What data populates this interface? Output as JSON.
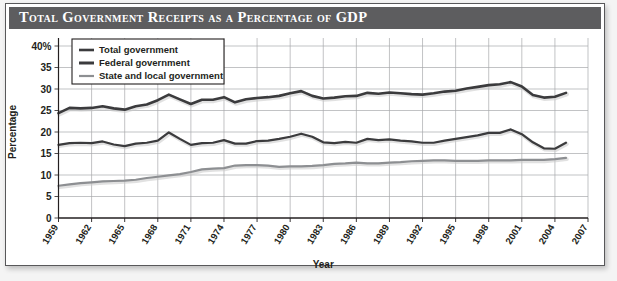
{
  "figure": {
    "title": "Total Government Receipts as a Percentage of GDP",
    "frame_color": "#58585a",
    "title_band_color": "#5d5d5f",
    "background_color": "#ffffff",
    "page_color": "#f2f2f2"
  },
  "chart_data": {
    "type": "line",
    "title": "Total Government Receipts as a Percentage of GDP",
    "xlabel": "Year",
    "ylabel": "Percentage",
    "xlim": [
      1959,
      2007
    ],
    "ylim": [
      0,
      40
    ],
    "yticks": [
      0,
      5,
      10,
      15,
      20,
      25,
      30,
      35,
      40
    ],
    "ytick_labels": [
      "0",
      "5",
      "10",
      "15",
      "20",
      "25",
      "30",
      "35",
      "40%"
    ],
    "xticks": [
      1959,
      1962,
      1965,
      1968,
      1971,
      1974,
      1977,
      1980,
      1983,
      1986,
      1989,
      1992,
      1995,
      1998,
      2001,
      2004,
      2007
    ],
    "xtick_labels": [
      "1959",
      "1962",
      "1965",
      "1968",
      "1971",
      "1974",
      "1977",
      "1980",
      "1983",
      "1986",
      "1989",
      "1992",
      "1995",
      "1998",
      "2001",
      "2004",
      "2007"
    ],
    "grid": true,
    "grid_color": "#a7a9ac",
    "legend_position": "top-left",
    "x": [
      1959,
      1960,
      1961,
      1962,
      1963,
      1964,
      1965,
      1966,
      1967,
      1968,
      1969,
      1970,
      1971,
      1972,
      1973,
      1974,
      1975,
      1976,
      1977,
      1978,
      1979,
      1980,
      1981,
      1982,
      1983,
      1984,
      1985,
      1986,
      1987,
      1988,
      1989,
      1990,
      1991,
      1992,
      1993,
      1994,
      1995,
      1996,
      1997,
      1998,
      1999,
      2000,
      2001,
      2002,
      2003,
      2004,
      2005
    ],
    "series": [
      {
        "name": "Total government",
        "color": "#3b3b3d",
        "width": 2.6,
        "values": [
          24.4,
          25.6,
          25.5,
          25.6,
          26.0,
          25.5,
          25.2,
          26.0,
          26.4,
          27.4,
          28.7,
          27.6,
          26.5,
          27.5,
          27.5,
          28.1,
          26.9,
          27.6,
          27.9,
          28.1,
          28.4,
          29.0,
          29.5,
          28.4,
          27.8,
          28.0,
          28.3,
          28.4,
          29.1,
          28.9,
          29.2,
          29.0,
          28.8,
          28.7,
          29.0,
          29.4,
          29.6,
          30.1,
          30.5,
          30.9,
          31.1,
          31.6,
          30.6,
          28.6,
          28.0,
          28.2,
          29.1
        ]
      },
      {
        "name": "Federal government",
        "color": "#3b3b3d",
        "width": 2.2,
        "values": [
          17.0,
          17.4,
          17.5,
          17.4,
          17.8,
          17.1,
          16.7,
          17.3,
          17.5,
          18.0,
          19.9,
          18.4,
          17.0,
          17.4,
          17.5,
          18.1,
          17.3,
          17.3,
          17.9,
          18.0,
          18.4,
          18.9,
          19.6,
          18.9,
          17.6,
          17.4,
          17.7,
          17.5,
          18.4,
          18.1,
          18.3,
          18.0,
          17.8,
          17.5,
          17.5,
          18.0,
          18.4,
          18.8,
          19.2,
          19.8,
          19.8,
          20.6,
          19.5,
          17.6,
          16.2,
          16.1,
          17.5
        ]
      },
      {
        "name": "State and local government",
        "color": "#8d8f92",
        "width": 2.2,
        "values": [
          7.5,
          7.8,
          8.1,
          8.3,
          8.5,
          8.6,
          8.7,
          8.9,
          9.3,
          9.6,
          9.9,
          10.2,
          10.7,
          11.3,
          11.5,
          11.6,
          12.2,
          12.3,
          12.3,
          12.2,
          11.9,
          12.0,
          12.0,
          12.1,
          12.3,
          12.6,
          12.7,
          12.9,
          12.7,
          12.7,
          12.9,
          13.0,
          13.2,
          13.3,
          13.4,
          13.4,
          13.3,
          13.3,
          13.3,
          13.4,
          13.4,
          13.4,
          13.5,
          13.5,
          13.5,
          13.7,
          14.0
        ]
      }
    ]
  },
  "legend": {
    "items": [
      {
        "label": "Total government",
        "color": "#3b3b3d"
      },
      {
        "label": "Federal government",
        "color": "#3b3b3d"
      },
      {
        "label": "State and local government",
        "color": "#8d8f92"
      }
    ]
  }
}
